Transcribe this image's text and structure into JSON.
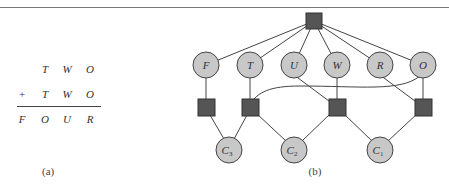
{
  "puzzle": {
    "row1": [
      "T",
      "W",
      "O"
    ],
    "row2_op": "+",
    "row2": [
      "T",
      "W",
      "O"
    ],
    "result": [
      "F",
      "O",
      "U",
      "R"
    ],
    "caption": "(a)"
  },
  "graph": {
    "caption": "(b)",
    "variables": [
      "F",
      "T",
      "U",
      "W",
      "R",
      "O"
    ],
    "carries": [
      "C3",
      "C2",
      "C1"
    ],
    "carry_labels": [
      {
        "base": "C",
        "sub": "3"
      },
      {
        "base": "C",
        "sub": "2"
      },
      {
        "base": "C",
        "sub": "1"
      }
    ],
    "colors": {
      "node_fill": "#c8c8c8",
      "constraint_fill": "#555555",
      "edge": "#444444"
    }
  }
}
